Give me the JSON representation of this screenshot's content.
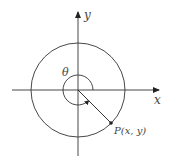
{
  "diagram": {
    "type": "unit-circle-angle",
    "axes": {
      "x_label": "x",
      "y_label": "y"
    },
    "angle_label": "θ",
    "point_label": "P(x, y)",
    "colors": {
      "stroke": "#333333",
      "text": "#444444",
      "background": "#ffffff"
    }
  }
}
